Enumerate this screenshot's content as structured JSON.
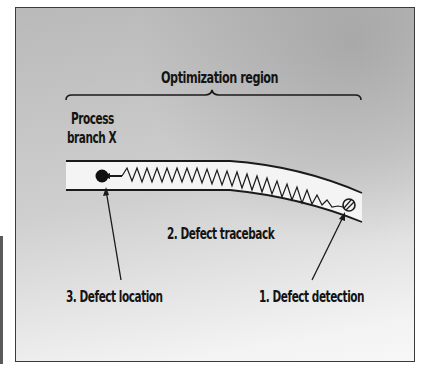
{
  "diagram": {
    "title_label": "Optimization region",
    "branch_label_line1": "Process",
    "branch_label_line2": "branch X",
    "steps": [
      {
        "label": "1. Defect detection"
      },
      {
        "label": "2. Defect traceback"
      },
      {
        "label": "3. Defect location"
      }
    ],
    "colors": {
      "background_gray": "#c4c4c4",
      "branch_fill": "#f4f4f4",
      "ink": "#141414"
    }
  }
}
